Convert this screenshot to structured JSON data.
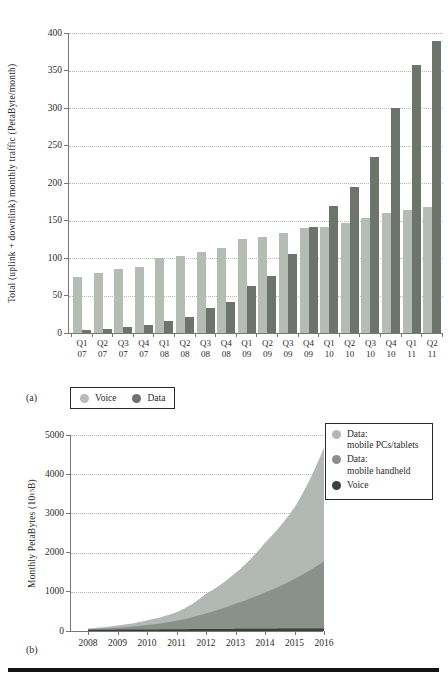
{
  "panels": {
    "a_label": "(a)",
    "b_label": "(b)"
  },
  "colors": {
    "voice_bar": "#b5bbb5",
    "data_bar": "#6d746e",
    "area_pcs_tablets": "#b2b8b3",
    "area_handheld": "#8a918b",
    "area_voice": "#3b403d",
    "axis": "#777777",
    "grid": "#b8b8b8",
    "text": "#2b2b2b",
    "legend_border": "#2a2a2a",
    "bottom_rule": "#141414"
  },
  "chart_data": [
    {
      "id": "mobile-traffic-by-quarter",
      "type": "bar",
      "title": "",
      "xlabel": "",
      "ylabel": "Total (uplink + downlink) monthly traffic (PetaByte/month)",
      "ylim": [
        0,
        400
      ],
      "yticks": [
        0,
        50,
        100,
        150,
        200,
        250,
        300,
        350,
        400
      ],
      "grid": "horizontal-dotted",
      "legend_position": "below-left",
      "categories": [
        {
          "q": "Q1",
          "yr": "07"
        },
        {
          "q": "Q2",
          "yr": "07"
        },
        {
          "q": "Q3",
          "yr": "07"
        },
        {
          "q": "Q4",
          "yr": "07"
        },
        {
          "q": "Q1",
          "yr": "08"
        },
        {
          "q": "Q2",
          "yr": "08"
        },
        {
          "q": "Q3",
          "yr": "08"
        },
        {
          "q": "Q4",
          "yr": "08"
        },
        {
          "q": "Q1",
          "yr": "09"
        },
        {
          "q": "Q2",
          "yr": "09"
        },
        {
          "q": "Q3",
          "yr": "09"
        },
        {
          "q": "Q4",
          "yr": "09"
        },
        {
          "q": "Q1",
          "yr": "10"
        },
        {
          "q": "Q2",
          "yr": "10"
        },
        {
          "q": "Q3",
          "yr": "10"
        },
        {
          "q": "Q4",
          "yr": "10"
        },
        {
          "q": "Q1",
          "yr": "11"
        },
        {
          "q": "Q2",
          "yr": "11"
        }
      ],
      "series": [
        {
          "name": "Voice",
          "color_key": "voice_bar",
          "values": [
            75,
            80,
            85,
            88,
            100,
            103,
            108,
            113,
            125,
            128,
            134,
            140,
            141,
            147,
            153,
            160,
            164,
            168
          ]
        },
        {
          "name": "Data",
          "color_key": "data_bar",
          "values": [
            4,
            6,
            8,
            11,
            16,
            21,
            33,
            42,
            63,
            76,
            105,
            142,
            170,
            195,
            235,
            300,
            358,
            390
          ]
        }
      ],
      "legend_items": [
        {
          "label": "Voice",
          "color_key": "voice_bar"
        },
        {
          "label": "Data",
          "color_key": "data_bar"
        }
      ]
    },
    {
      "id": "monthly-petabytes-forecast",
      "type": "area",
      "title": "",
      "xlabel": "",
      "ylabel_prefix": "Monthly PetaBytes (10",
      "ylabel_sup": "15",
      "ylabel_suffix": " B)",
      "ylim": [
        0,
        5000
      ],
      "yticks": [
        0,
        1000,
        2000,
        3000,
        4000,
        5000
      ],
      "grid": "horizontal-dotted",
      "legend_position": "top-right",
      "x": [
        2008,
        2009,
        2010,
        2011,
        2012,
        2013,
        2014,
        2015,
        2016
      ],
      "layers_bottom_up": [
        {
          "name": "Voice",
          "color_key": "area_voice",
          "top_values": [
            30,
            35,
            40,
            45,
            50,
            55,
            58,
            62,
            65
          ]
        },
        {
          "name": "Data: mobile handheld",
          "color_key": "area_handheld",
          "top_values": [
            45,
            85,
            150,
            260,
            450,
            700,
            980,
            1330,
            1780
          ]
        },
        {
          "name": "Data: mobile PCs/tablets",
          "color_key": "area_pcs_tablets",
          "top_values": [
            65,
            140,
            270,
            480,
            950,
            1480,
            2250,
            3150,
            4680
          ]
        }
      ],
      "legend_items": [
        {
          "lines": [
            "Data:",
            "mobile PCs/tablets"
          ],
          "color_key": "area_pcs_tablets"
        },
        {
          "lines": [
            "Data:",
            "mobile handheld"
          ],
          "color_key": "area_handheld"
        },
        {
          "lines": [
            "Voice"
          ],
          "color_key": "area_voice"
        }
      ]
    }
  ]
}
